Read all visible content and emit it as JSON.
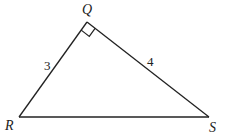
{
  "diagram": {
    "type": "right-triangle",
    "vertices": {
      "Q": {
        "label": "Q",
        "x": 87,
        "y": 22
      },
      "R": {
        "label": "R",
        "x": 19,
        "y": 117
      },
      "S": {
        "label": "S",
        "x": 209,
        "y": 117
      }
    },
    "sides": {
      "QR": {
        "label": "3"
      },
      "QS": {
        "label": "4"
      },
      "RS": {
        "label": ""
      }
    },
    "right_angle_at": "Q",
    "stroke_color": "#222222"
  }
}
